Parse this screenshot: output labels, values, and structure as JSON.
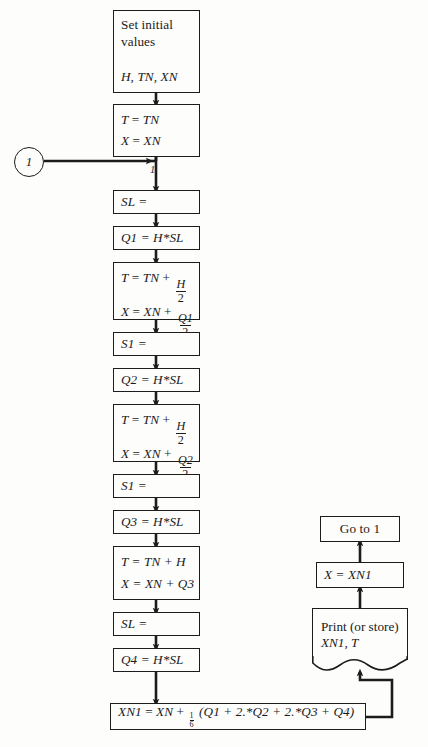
{
  "diagram": {
    "type": "flowchart",
    "stroke_color": "#1c1c1c",
    "background_color": "#fdfdfc"
  },
  "connector": {
    "label": "1",
    "name": "entry-connector-1"
  },
  "edge_label": {
    "near_entry": "1"
  },
  "nodes": {
    "set_initial": {
      "title_line1": "Set initial",
      "title_line2": "values",
      "params": "H, TN, XN"
    },
    "init_assign": {
      "line1_lhs": "T",
      "line1_rhs": "TN",
      "line2_lhs": "X",
      "line2_rhs": "XN"
    },
    "sl1": {
      "text": "SL ="
    },
    "q1": {
      "text": "Q1 = H*SL"
    },
    "step1": {
      "t_lhs": "T",
      "t_base": "TN",
      "t_num": "H",
      "t_den": "2",
      "x_lhs": "X",
      "x_base": "XN",
      "x_num": "Q1",
      "x_den": "2"
    },
    "s1_a": {
      "text": "S1 ="
    },
    "q2": {
      "text": "Q2 = H*SL"
    },
    "step2": {
      "t_lhs": "T",
      "t_base": "TN",
      "t_num": "H",
      "t_den": "2",
      "x_lhs": "X",
      "x_base": "XN",
      "x_num": "Q2",
      "x_den": "2"
    },
    "s1_b": {
      "text": "S1 ="
    },
    "q3": {
      "text": "Q3 = H*SL"
    },
    "step3": {
      "t_line": "T = TN + H",
      "x_line": "X = XN + Q3"
    },
    "sl2": {
      "text": "SL ="
    },
    "q4": {
      "text": "Q4 = H*SL"
    },
    "final": {
      "lhs": "XN1",
      "base": "XN",
      "frac_num": "1",
      "frac_den": "6",
      "expr": "(Q1 + 2.*Q2 + 2.*Q3 + Q4)"
    },
    "print": {
      "line1": "Print (or store)",
      "line2": "XN1,  T"
    },
    "assign_x": {
      "text": "X = XN1"
    },
    "goto": {
      "text": "Go to 1"
    }
  }
}
